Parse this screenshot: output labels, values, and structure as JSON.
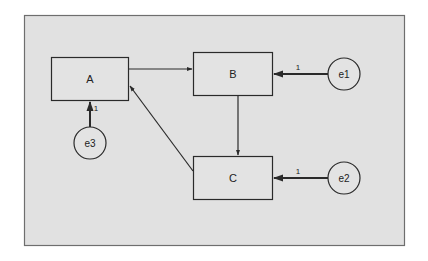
{
  "canvas": {
    "background": "#ffffff",
    "frame_fill": "#e1e1e1",
    "frame_stroke": "#6e6e6e",
    "node_fill": "#e3e3e3",
    "stroke": "#2a2a2a",
    "text_color": "#222222"
  },
  "nodes": {
    "A": {
      "label": "A",
      "type": "observed"
    },
    "B": {
      "label": "B",
      "type": "observed"
    },
    "C": {
      "label": "C",
      "type": "observed"
    },
    "e1": {
      "label": "e1",
      "type": "error"
    },
    "e2": {
      "label": "e2",
      "type": "error"
    },
    "e3": {
      "label": "e3",
      "type": "error"
    }
  },
  "edges": [
    {
      "from": "A",
      "to": "B",
      "label": ""
    },
    {
      "from": "B",
      "to": "C",
      "label": ""
    },
    {
      "from": "C",
      "to": "A",
      "label": ""
    },
    {
      "from": "e1",
      "to": "B",
      "label": "1"
    },
    {
      "from": "e2",
      "to": "C",
      "label": "1"
    },
    {
      "from": "e3",
      "to": "A",
      "label": "1"
    }
  ],
  "edge_labels": {
    "e1_B": "1",
    "e2_C": "1",
    "e3_A": "1"
  }
}
